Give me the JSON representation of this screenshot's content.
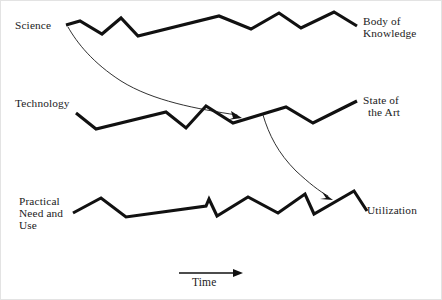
{
  "figure": {
    "background_color": "#ffffff",
    "line_color": "#111111",
    "text_color": "#1b1b1b"
  },
  "labels": {
    "science": "Science",
    "body_of_knowledge_line1": "Body of",
    "body_of_knowledge_line2": "Knowledge",
    "technology": "Technology",
    "state_of_the_art_line1": "State of",
    "state_of_the_art_line2": "the Art",
    "practical_line1": "Practical",
    "practical_line2": "Need and",
    "practical_line3": "Use",
    "utilization": "Utilization",
    "time_axis": "Time"
  },
  "chart_data": {
    "type": "line",
    "title": "",
    "xlabel": "Time",
    "ylabel": "",
    "grid": false,
    "legend": "none",
    "series": [
      {
        "name": "Science → Body of Knowledge",
        "start_label": "Science",
        "end_label": "Body of Knowledge",
        "points": [
          [
            65,
            24
          ],
          [
            79,
            20
          ],
          [
            101,
            33
          ],
          [
            120,
            17
          ],
          [
            137,
            35
          ],
          [
            218,
            15
          ],
          [
            250,
            28
          ],
          [
            278,
            12
          ],
          [
            300,
            27
          ],
          [
            333,
            11
          ],
          [
            356,
            25
          ]
        ]
      },
      {
        "name": "Technology → State of the Art",
        "start_label": "Technology",
        "end_label": "State of the Art",
        "points": [
          [
            75,
            112
          ],
          [
            95,
            128
          ],
          [
            165,
            111
          ],
          [
            185,
            127
          ],
          [
            205,
            105
          ],
          [
            232,
            122
          ],
          [
            285,
            106
          ],
          [
            312,
            122
          ],
          [
            356,
            100
          ]
        ]
      },
      {
        "name": "Practical Need and Use → Utilization",
        "start_label": "Practical Need and Use",
        "end_label": "Utilization",
        "points": [
          [
            72,
            212
          ],
          [
            100,
            197
          ],
          [
            125,
            216
          ],
          [
            205,
            205
          ],
          [
            208,
            198
          ],
          [
            216,
            215
          ],
          [
            247,
            196
          ],
          [
            277,
            212
          ],
          [
            304,
            193
          ],
          [
            313,
            213
          ],
          [
            353,
            190
          ],
          [
            366,
            210
          ]
        ]
      }
    ],
    "annotations": [
      {
        "name": "science-to-state-of-the-art-arrow",
        "from": "Science",
        "to": "State of the Art line",
        "start": [
          67,
          26
        ],
        "end": [
          240,
          117
        ],
        "style": "curved-arrow"
      },
      {
        "name": "state-of-the-art-to-utilization-arrow",
        "from": "State of the Art line",
        "to": "Utilization line",
        "start": [
          262,
          114
        ],
        "end": [
          331,
          198
        ],
        "style": "curved-arrow"
      }
    ],
    "axis": {
      "name": "time-arrow",
      "label": "Time",
      "from": [
        178,
        272
      ],
      "to": [
        241,
        272
      ],
      "direction": "right"
    }
  }
}
